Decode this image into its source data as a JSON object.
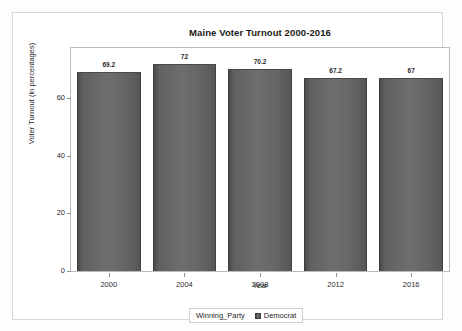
{
  "chart_data": {
    "type": "bar",
    "title": "Maine Voter Turnout 2000-2016",
    "xlabel": "Year",
    "ylabel": "Voter Turnout (in percentages)",
    "categories": [
      "2000",
      "2004",
      "2008",
      "2012",
      "2016"
    ],
    "values": [
      69.2,
      72,
      70.2,
      67.2,
      67
    ],
    "value_labels": [
      "69.2",
      "72",
      "70.2",
      "67.2",
      "67"
    ],
    "ylim": [
      0,
      77.5
    ],
    "yticks": [
      0,
      20,
      40,
      60
    ],
    "ytick_labels": [
      "0",
      "20",
      "40",
      "60"
    ],
    "grid": false,
    "legend_position": "bottom",
    "legend": {
      "title": "Winning_Party",
      "entries": [
        {
          "label": "Democrat",
          "color": "#5f5f5f"
        }
      ]
    },
    "series": [
      {
        "name": "Democrat",
        "values": [
          69.2,
          72,
          70.2,
          67.2,
          67
        ],
        "color": "#5f5f5f"
      }
    ]
  },
  "colors": {
    "bar_fill": "#5f5f5f",
    "bar_edge": "#3d3d3d",
    "axis_line": "#b9b9b9",
    "frame": "#d8d8d8",
    "text": "#1f1f1f",
    "background": "#ffffff"
  }
}
